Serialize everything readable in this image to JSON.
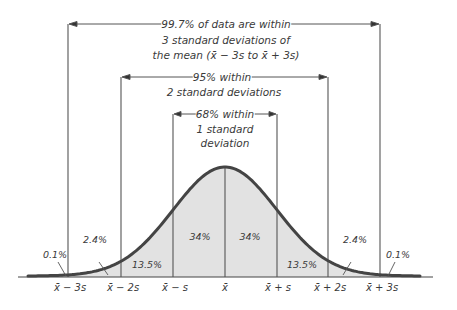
{
  "colors": {
    "curve": "#444444",
    "fill": "#e2e2e2",
    "lines": "#555555",
    "text": "#3a3a3a"
  },
  "brackets": [
    {
      "id": "three_sd",
      "lines": [
        "99.7% of data are within",
        "3 standard deviations of",
        "the mean (x̄ − 3s to x̄ + 3s)"
      ]
    },
    {
      "id": "two_sd",
      "lines": [
        "95% within",
        "2 standard deviations"
      ]
    },
    {
      "id": "one_sd",
      "lines": [
        "68% within",
        "1 standard",
        "deviation"
      ]
    }
  ],
  "regions": [
    {
      "label": "0.1%"
    },
    {
      "label": "2.4%"
    },
    {
      "label": "13.5%"
    },
    {
      "label": "34%"
    },
    {
      "label": "34%"
    },
    {
      "label": "13.5%"
    },
    {
      "label": "2.4%"
    },
    {
      "label": "0.1%"
    }
  ],
  "ticks": [
    "x̄ − 3s",
    "x̄ − 2s",
    "x̄ − s",
    "x̄",
    "x̄ + s",
    "x̄ + 2s",
    "x̄ + 3s"
  ]
}
